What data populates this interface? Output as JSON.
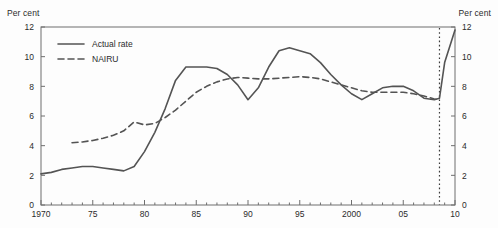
{
  "axis_unit_left": "Per cent",
  "axis_unit_right": "Per cent",
  "title_cropped": "",
  "legend": {
    "actual_label": "Actual rate",
    "nairu_label": "NAIRU"
  },
  "chart_data": {
    "type": "line",
    "title": "",
    "xlabel": "",
    "ylabel": "Per cent",
    "ylim": [
      0,
      12
    ],
    "xlim": [
      1970,
      2010
    ],
    "grid": false,
    "legend_position": "top-left",
    "ytick_labels": [
      "0",
      "2",
      "4",
      "6",
      "8",
      "10",
      "12"
    ],
    "ytick_values": [
      0,
      2,
      4,
      6,
      8,
      10,
      12
    ],
    "xtick_labels": [
      "1970",
      "75",
      "80",
      "85",
      "90",
      "95",
      "2000",
      "05",
      "10"
    ],
    "xtick_values": [
      1970,
      1975,
      1980,
      1985,
      1990,
      1995,
      2000,
      2005,
      2010
    ],
    "minor_xtick_interval": 1,
    "annotations": [
      {
        "type": "vertical-dotted-line",
        "x": 2008.5,
        "label": ""
      }
    ],
    "series": [
      {
        "name": "Actual rate",
        "style": "solid",
        "color": "#545454",
        "x": [
          1970,
          1971,
          1972,
          1973,
          1974,
          1975,
          1976,
          1977,
          1978,
          1979,
          1980,
          1981,
          1982,
          1983,
          1984,
          1985,
          1986,
          1987,
          1988,
          1989,
          1990,
          1991,
          1992,
          1993,
          1994,
          1995,
          1996,
          1997,
          1998,
          1999,
          2000,
          2001,
          2002,
          2003,
          2004,
          2005,
          2006,
          2007,
          2008,
          2008.5,
          2009,
          2010
        ],
        "values": [
          2.1,
          2.2,
          2.4,
          2.5,
          2.6,
          2.6,
          2.5,
          2.4,
          2.3,
          2.6,
          3.6,
          4.9,
          6.5,
          8.4,
          9.3,
          9.3,
          9.3,
          9.2,
          8.8,
          8.1,
          7.1,
          7.9,
          9.3,
          10.4,
          10.6,
          10.4,
          10.2,
          9.6,
          8.8,
          8.1,
          7.5,
          7.1,
          7.5,
          7.9,
          8.0,
          8.0,
          7.7,
          7.2,
          7.1,
          7.2,
          9.6,
          11.8
        ]
      },
      {
        "name": "NAIRU",
        "style": "dashed",
        "color": "#545454",
        "x": [
          1973,
          1974,
          1975,
          1976,
          1977,
          1978,
          1979,
          1980,
          1981,
          1982,
          1983,
          1984,
          1985,
          1986,
          1987,
          1988,
          1989,
          1990,
          1991,
          1992,
          1993,
          1994,
          1995,
          1996,
          1997,
          1998,
          1999,
          2000,
          2001,
          2002,
          2003,
          2004,
          2005,
          2006,
          2007,
          2008,
          2008.5
        ],
        "values": [
          4.2,
          4.25,
          4.35,
          4.5,
          4.7,
          5.0,
          5.6,
          5.4,
          5.5,
          5.9,
          6.4,
          7.0,
          7.6,
          8.0,
          8.3,
          8.5,
          8.6,
          8.55,
          8.5,
          8.5,
          8.55,
          8.6,
          8.65,
          8.6,
          8.5,
          8.3,
          8.1,
          7.9,
          7.7,
          7.6,
          7.6,
          7.6,
          7.6,
          7.5,
          7.35,
          7.15,
          7.1
        ]
      }
    ]
  }
}
